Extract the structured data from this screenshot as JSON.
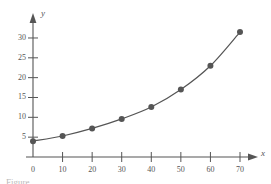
{
  "figure": {
    "caption": "Figure",
    "background": "#ffffff",
    "ink_color": "#555555"
  },
  "axes": {
    "x_axis_name": "x",
    "y_axis_name": "y",
    "x_ticks": [
      0,
      10,
      20,
      30,
      40,
      50,
      60,
      70
    ],
    "y_ticks": [
      5,
      10,
      15,
      20,
      25,
      30
    ],
    "x_tick_labels": [
      "0",
      "10",
      "20",
      "30",
      "40",
      "50",
      "60",
      "70"
    ],
    "y_tick_labels": [
      "5",
      "10",
      "15",
      "20",
      "25",
      "30"
    ],
    "x_arrow": true,
    "y_arrow": true
  },
  "chart_data": {
    "type": "line",
    "title": "",
    "xlabel": "x",
    "ylabel": "y",
    "xlim": [
      0,
      75
    ],
    "ylim": [
      0,
      33
    ],
    "grid": false,
    "legend": null,
    "marker": "circle",
    "marker_color": "#555555",
    "line_color": "#555555",
    "x": [
      0,
      10,
      20,
      30,
      40,
      50,
      60,
      70
    ],
    "values": [
      4.0,
      5.3,
      7.2,
      9.6,
      12.6,
      17.0,
      23.0,
      31.5
    ],
    "series": [
      {
        "name": "curve",
        "x": [
          0,
          10,
          20,
          30,
          40,
          50,
          60,
          70
        ],
        "values": [
          4.0,
          5.3,
          7.2,
          9.6,
          12.6,
          17.0,
          23.0,
          31.5
        ]
      }
    ]
  }
}
